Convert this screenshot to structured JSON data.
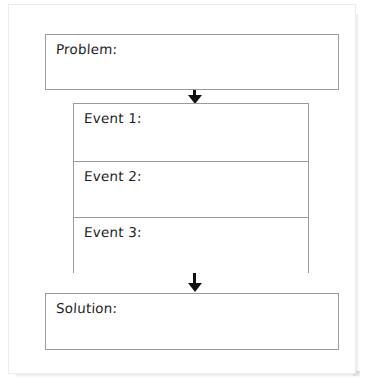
{
  "document": {
    "type": "graphic-organizer-worksheet",
    "title": "Problem and Solution Graphic Organizer"
  },
  "boxes": {
    "problem": {
      "label": "Problem:",
      "value": ""
    },
    "solution": {
      "label": "Solution:",
      "value": ""
    }
  },
  "events": [
    {
      "label": "Event 1:",
      "value": ""
    },
    {
      "label": "Event 2:",
      "value": ""
    },
    {
      "label": "Event 3:",
      "value": ""
    }
  ],
  "arrows": [
    {
      "name": "problem-to-events",
      "direction": "down"
    },
    {
      "name": "events-to-solution",
      "direction": "down"
    }
  ],
  "colors": {
    "page_background": "#ffffff",
    "box_border": "#9a9a9e",
    "sheet_border": "#ececed",
    "text": "#1d1d1f",
    "arrow": "#111114"
  }
}
